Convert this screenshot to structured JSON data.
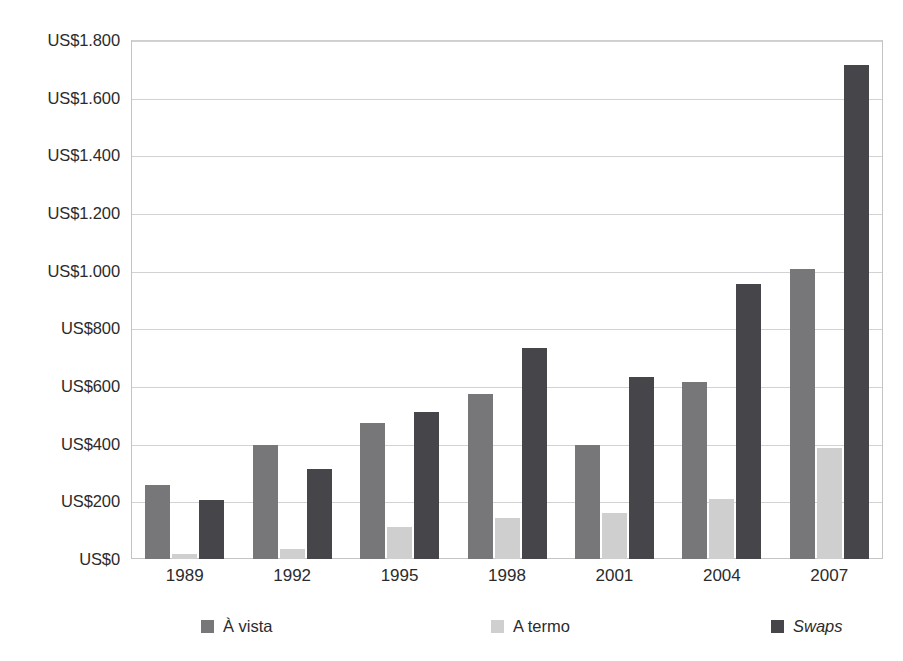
{
  "figure": {
    "caption_remnant": "",
    "background_color": "#ffffff"
  },
  "chart_data": {
    "type": "bar",
    "title": "",
    "subtitle": "",
    "xlabel": "",
    "ylabel": "",
    "categories": [
      "1989",
      "1992",
      "1995",
      "1998",
      "2001",
      "2004",
      "2007"
    ],
    "series": [
      {
        "name": "À vista",
        "color": "#77777a",
        "italic": false,
        "values": [
          255,
          394,
          472,
          572,
          397,
          614,
          1005
        ]
      },
      {
        "name": "A termo",
        "color": "#cfcfd0",
        "italic": false,
        "values": [
          17,
          35,
          110,
          141,
          159,
          207,
          386
        ]
      },
      {
        "name": "Swaps",
        "color": "#45454a",
        "italic": true,
        "values": [
          203,
          312,
          510,
          731,
          631,
          954,
          1714
        ]
      }
    ],
    "ylim": [
      0,
      1800
    ],
    "ytick_values": [
      0,
      200,
      400,
      600,
      800,
      1000,
      1200,
      1400,
      1600,
      1800
    ],
    "ytick_labels": [
      "US$0",
      "US$200",
      "US$400",
      "US$600",
      "US$800",
      "US$1.000",
      "US$1.200",
      "US$1.400",
      "US$1.600",
      "US$1.800"
    ],
    "grid": true,
    "grid_axis": "y",
    "grid_color": "#d2d2d4",
    "legend_position": "bottom",
    "legend_entries": [
      "À vista",
      "A termo",
      "Swaps"
    ],
    "bar_group_spacing": true,
    "annotations": []
  }
}
